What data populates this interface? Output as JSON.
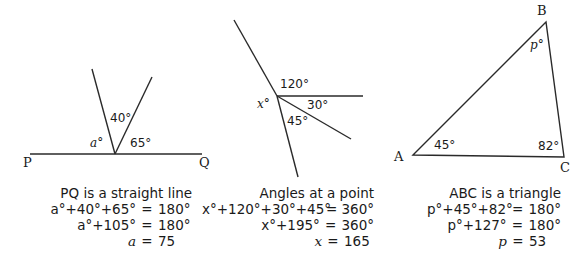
{
  "diagrams": [
    {
      "id": "straight-line",
      "points": {
        "P": "P",
        "Q": "Q"
      },
      "angles": {
        "a": "a°",
        "forty": "40°",
        "sixtyfive": "65°"
      },
      "caption": {
        "title": "PQ is a straight line",
        "rows": [
          {
            "lhs": "a°+40°+65°",
            "eq": "=",
            "rhs": "180°"
          },
          {
            "lhs": "a°+105°",
            "eq": "=",
            "rhs": "180°"
          },
          {
            "lhs": "a",
            "eq": "=",
            "rhs": "75"
          }
        ]
      }
    },
    {
      "id": "angles-at-point",
      "angles": {
        "x": "x°",
        "onetwenty": "120°",
        "thirty": "30°",
        "fortyfive": "45°"
      },
      "caption": {
        "title": "Angles at a point",
        "rows": [
          {
            "lhs": "x°+120°+30°+45°",
            "eq": "=",
            "rhs": "360°"
          },
          {
            "lhs": "x°+195°",
            "eq": "=",
            "rhs": "360°"
          },
          {
            "lhs": "x",
            "eq": "=",
            "rhs": "165"
          }
        ]
      }
    },
    {
      "id": "triangle",
      "points": {
        "A": "A",
        "B": "B",
        "C": "C"
      },
      "angles": {
        "p": "p°",
        "fortyfive": "45°",
        "eightytwo": "82°"
      },
      "caption": {
        "title": "ABC is a triangle",
        "rows": [
          {
            "lhs": "p°+45°+82°",
            "eq": "=",
            "rhs": "180°"
          },
          {
            "lhs": "p°+127°",
            "eq": "=",
            "rhs": "180°"
          },
          {
            "lhs": "p",
            "eq": "=",
            "rhs": "53"
          }
        ]
      }
    }
  ]
}
